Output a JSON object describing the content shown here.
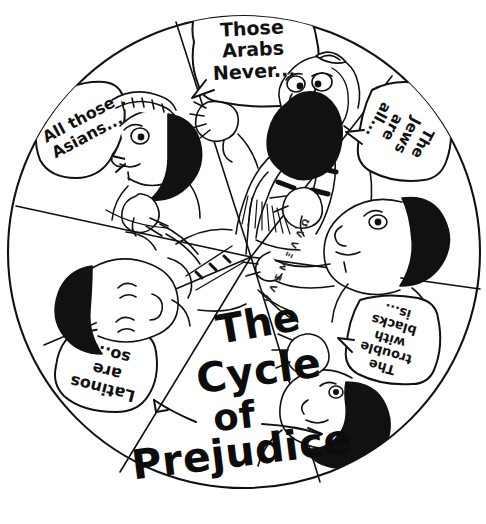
{
  "image": {
    "kind": "hand-drawn cartoon diagram",
    "title_words": [
      "The",
      "Cycle",
      "of",
      "Prejudice"
    ],
    "title_full": "The Cycle of Prejudice",
    "background_color": "#ffffff",
    "ink_color": "#111111"
  },
  "wheel": {
    "center_x": 244,
    "center_y": 252,
    "radius": 237,
    "segment_count": 6,
    "segments": [
      {
        "id": "arabs",
        "position": "top",
        "speech_text": "Those\nArabs\nNever...",
        "speaker": "bearded man wearing kippah and tallit prayer shawl, hand raised",
        "bubble_shape": "rounded speech balloon",
        "text_rotation_deg": 0
      },
      {
        "id": "jews",
        "position": "upper-right",
        "speech_text": "The\nJews\nare\nall...",
        "speaker": "man with dark curly hair, pointing finger",
        "bubble_shape": "rounded speech balloon",
        "text_rotation_deg": 118
      },
      {
        "id": "blacks",
        "position": "lower-right",
        "speech_text": "The\ntrouble\nwith\nblacks\nis...",
        "speaker": "man with dark hair and beard, hand raised",
        "bubble_shape": "rounded speech balloon",
        "text_rotation_deg": 180
      },
      {
        "id": "latinos",
        "position": "lower-left",
        "speech_text": "Latinos\nare\nso...",
        "speaker": "man with dark hair in collared shirt and tie",
        "bubble_shape": "rounded speech balloon",
        "text_rotation_deg": 180
      },
      {
        "id": "asians",
        "position": "upper-left",
        "speech_text": "All those\nAsians...",
        "speaker": "person with headband and dark hair, pointing finger",
        "bubble_shape": "rounded speech balloon",
        "text_rotation_deg": -28
      },
      {
        "id": "title-wedge",
        "position": "bottom-center",
        "speech_text": "",
        "speaker": "none - contains the diagram title",
        "bubble_shape": "none",
        "text_rotation_deg": 0
      }
    ]
  },
  "center_label": {
    "line1": "The",
    "line2": "Cycle",
    "line3": "of",
    "line4": "Prejudice",
    "left_arrow": "curved arrow pointing left",
    "right_arrow": "straight arrow pointing right"
  },
  "decoration": {
    "sleeve_marks": "V Λ Σ M Ξ Λ Λ Ω"
  }
}
